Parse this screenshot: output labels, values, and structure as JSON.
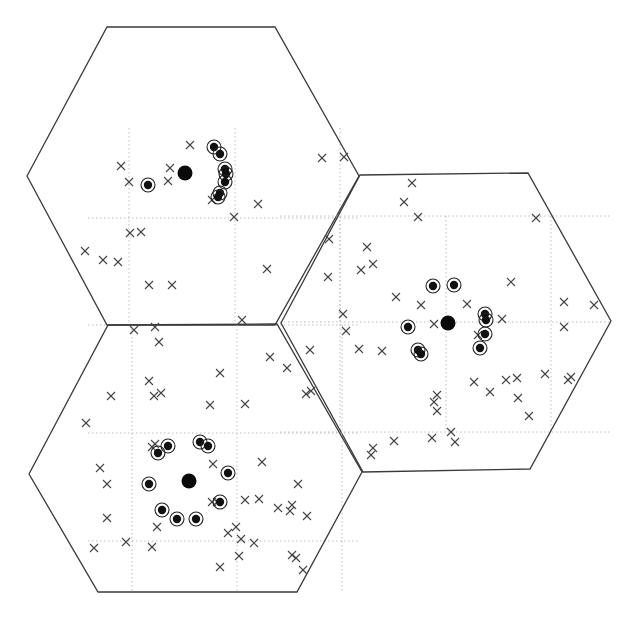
{
  "diagram": {
    "title": "",
    "colors": {
      "edge": "#3a3a3a",
      "grid": "#b8b8b8",
      "marker": "#444444",
      "fill": "#111111"
    },
    "cells": [
      {
        "name": "cell-top-left",
        "vertices": [
          [
            27,
            176
          ],
          [
            107,
            27
          ],
          [
            275,
            27
          ],
          [
            359,
            176
          ],
          [
            275,
            325
          ],
          [
            107,
            325
          ]
        ],
        "base_station": [
          185,
          173
        ],
        "grid_x": [
          129,
          235,
          340
        ],
        "grid_y": [
          218,
          325
        ],
        "grid_extent": [
          88,
          128,
          360,
          325
        ],
        "served_users": [
          [
            148,
            185
          ],
          [
            214,
            147
          ],
          [
            220,
            154
          ],
          [
            225,
            169
          ],
          [
            226,
            174
          ],
          [
            225,
            182
          ],
          [
            220,
            193
          ],
          [
            218,
            197
          ]
        ],
        "other_users": [
          [
            190,
            145
          ],
          [
            121,
            166
          ],
          [
            170,
            168
          ],
          [
            129,
            182
          ],
          [
            168,
            181
          ],
          [
            212,
            200
          ],
          [
            258,
            204
          ],
          [
            234,
            217
          ],
          [
            130,
            233
          ],
          [
            141,
            232
          ],
          [
            85,
            251
          ],
          [
            103,
            260
          ],
          [
            118,
            262
          ],
          [
            267,
            269
          ],
          [
            149,
            285
          ],
          [
            172,
            285
          ],
          [
            322,
            158
          ],
          [
            344,
            157
          ],
          [
            242,
            320
          ]
        ]
      },
      {
        "name": "cell-right",
        "vertices": [
          [
            281,
            323
          ],
          [
            360,
            175
          ],
          [
            528,
            173
          ],
          [
            611,
            321
          ],
          [
            530,
            469
          ],
          [
            363,
            472
          ]
        ],
        "base_station": [
          448,
          323
        ],
        "grid_x": [
          340,
          446,
          551
        ],
        "grid_y": [
          216,
          322,
          432
        ],
        "grid_extent": [
          280,
          216,
          611,
          432
        ],
        "served_users": [
          [
            433,
            286
          ],
          [
            454,
            285
          ],
          [
            485,
            314
          ],
          [
            486,
            320
          ],
          [
            485,
            334
          ],
          [
            480,
            348
          ],
          [
            408,
            327
          ],
          [
            418,
            350
          ],
          [
            421,
            354
          ]
        ],
        "other_users": [
          [
            412,
            183
          ],
          [
            404,
            202
          ],
          [
            418,
            217
          ],
          [
            536,
            218
          ],
          [
            329,
            239
          ],
          [
            367,
            247
          ],
          [
            373,
            264
          ],
          [
            361,
            270
          ],
          [
            328,
            277
          ],
          [
            511,
            282
          ],
          [
            396,
            297
          ],
          [
            421,
            305
          ],
          [
            467,
            304
          ],
          [
            502,
            319
          ],
          [
            564,
            302
          ],
          [
            594,
            305
          ],
          [
            343,
            314
          ],
          [
            434,
            324
          ],
          [
            346,
            331
          ],
          [
            478,
            335
          ],
          [
            359,
            349
          ],
          [
            382,
            351
          ],
          [
            310,
            350
          ],
          [
            564,
            327
          ],
          [
            474,
            382
          ],
          [
            490,
            392
          ],
          [
            506,
            380
          ],
          [
            517,
            378
          ],
          [
            518,
            398
          ],
          [
            545,
            374
          ],
          [
            571,
            377
          ],
          [
            568,
            380
          ],
          [
            529,
            416
          ],
          [
            437,
            395
          ],
          [
            434,
            402
          ],
          [
            437,
            411
          ],
          [
            311,
            391
          ],
          [
            306,
            394
          ],
          [
            373,
            448
          ],
          [
            394,
            441
          ],
          [
            432,
            438
          ],
          [
            451,
            432
          ],
          [
            455,
            442
          ],
          [
            371,
            455
          ]
        ]
      },
      {
        "name": "cell-bottom-left",
        "vertices": [
          [
            29,
            474
          ],
          [
            108,
            325
          ],
          [
            277,
            324
          ],
          [
            362,
            472
          ],
          [
            297,
            592
          ],
          [
            98,
            592
          ]
        ],
        "base_station": [
          189,
          481
        ],
        "grid_x": [
          132,
          237,
          342
        ],
        "grid_y": [
          433,
          541
        ],
        "grid_extent": [
          88,
          325,
          360,
          541
        ],
        "served_users": [
          [
            158,
            453
          ],
          [
            168,
            446
          ],
          [
            200,
            442
          ],
          [
            208,
            446
          ],
          [
            228,
            473
          ],
          [
            149,
            484
          ],
          [
            162,
            510
          ],
          [
            177,
            519
          ],
          [
            196,
            519
          ],
          [
            220,
            502
          ]
        ],
        "other_users": [
          [
            134,
            330
          ],
          [
            155,
            327
          ],
          [
            159,
            342
          ],
          [
            270,
            357
          ],
          [
            287,
            368
          ],
          [
            220,
            373
          ],
          [
            149,
            381
          ],
          [
            154,
            396
          ],
          [
            161,
            393
          ],
          [
            111,
            396
          ],
          [
            210,
            405
          ],
          [
            245,
            404
          ],
          [
            86,
            423
          ],
          [
            155,
            444
          ],
          [
            152,
            447
          ],
          [
            213,
            464
          ],
          [
            262,
            462
          ],
          [
            100,
            468
          ],
          [
            107,
            484
          ],
          [
            212,
            502
          ],
          [
            217,
            502
          ],
          [
            245,
            500
          ],
          [
            259,
            499
          ],
          [
            298,
            484
          ],
          [
            107,
            518
          ],
          [
            157,
            527
          ],
          [
            236,
            527
          ],
          [
            228,
            533
          ],
          [
            241,
            539
          ],
          [
            254,
            543
          ],
          [
            278,
            508
          ],
          [
            290,
            511
          ],
          [
            307,
            516
          ],
          [
            292,
            505
          ],
          [
            126,
            542
          ],
          [
            152,
            547
          ],
          [
            94,
            548
          ],
          [
            239,
            556
          ],
          [
            220,
            567
          ],
          [
            292,
            555
          ],
          [
            296,
            558
          ],
          [
            303,
            570
          ]
        ]
      }
    ],
    "legend": [
      {
        "symbol": "filled-large-circle",
        "meaning": "base station"
      },
      {
        "symbol": "ringed-dot",
        "meaning": "served user"
      },
      {
        "symbol": "cross",
        "meaning": "other user"
      }
    ]
  }
}
